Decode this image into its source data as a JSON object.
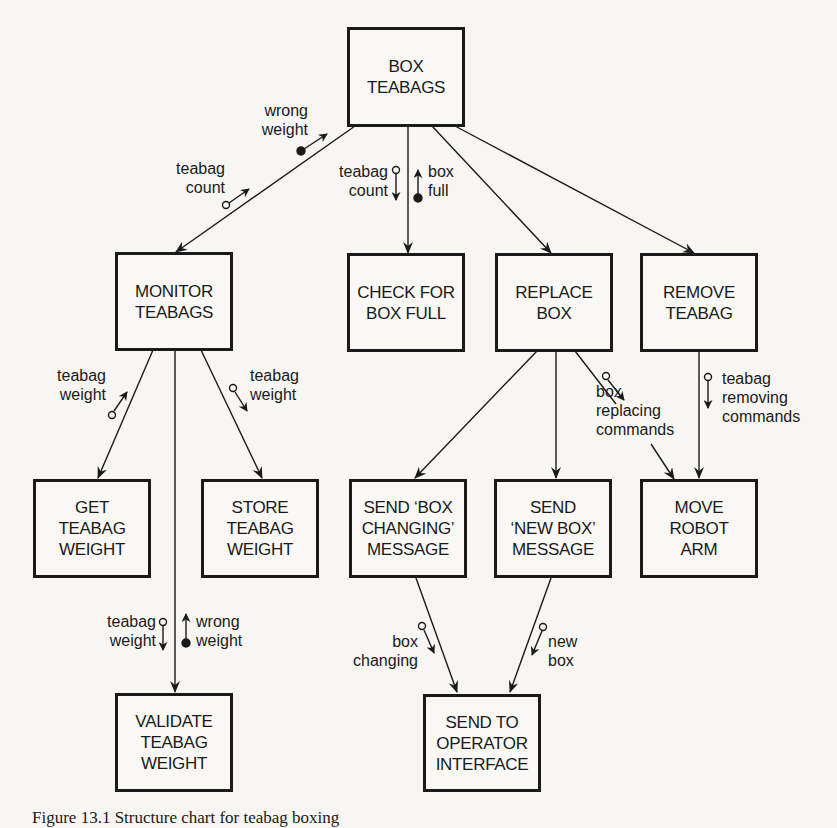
{
  "diagram": {
    "title": "Structure chart",
    "modules": {
      "box_teabags": "BOX\nTEABAGS",
      "monitor_teabags": "MONITOR\nTEABAGS",
      "check_for_box_full": "CHECK FOR\nBOX FULL",
      "replace_box": "REPLACE\nBOX",
      "remove_teabag": "REMOVE\nTEABAG",
      "get_teabag_weight": "GET\nTEABAG\nWEIGHT",
      "store_teabag_weight": "STORE\nTEABAG\nWEIGHT",
      "send_box_changing_message": "SEND ‘BOX\nCHANGING’\nMESSAGE",
      "send_new_box_message": "SEND\n‘NEW BOX’\nMESSAGE",
      "move_robot_arm": "MOVE\nROBOT\nARM",
      "validate_teabag_weight": "VALIDATE\nTEABAG\nWEIGHT",
      "send_to_operator_interface": "SEND TO\nOPERATOR\nINTERFACE"
    },
    "couples": {
      "wrong_weight_top": "wrong\nweight",
      "teabag_count_left": "teabag\ncount",
      "teabag_count_center": "teabag\ncount",
      "box_full": "box\nfull",
      "teabag_weight_get": "teabag\nweight",
      "teabag_weight_store": "teabag\nweight",
      "teabag_weight_validate": "teabag\nweight",
      "wrong_weight_validate": "wrong\nweight",
      "box_replacing_commands": "box\nreplacing\ncommands",
      "teabag_removing_commands": "teabag\nremoving\ncommands",
      "box_changing": "box\nchanging",
      "new_box": "new\nbox"
    },
    "connections": [
      {
        "from": "BOX TEABAGS",
        "to": "MONITOR TEABAGS"
      },
      {
        "from": "BOX TEABAGS",
        "to": "CHECK FOR BOX FULL"
      },
      {
        "from": "BOX TEABAGS",
        "to": "REPLACE BOX"
      },
      {
        "from": "BOX TEABAGS",
        "to": "REMOVE TEABAG"
      },
      {
        "from": "MONITOR TEABAGS",
        "to": "GET TEABAG WEIGHT"
      },
      {
        "from": "MONITOR TEABAGS",
        "to": "STORE TEABAG WEIGHT"
      },
      {
        "from": "MONITOR TEABAGS",
        "to": "VALIDATE TEABAG WEIGHT"
      },
      {
        "from": "REPLACE BOX",
        "to": "SEND 'BOX CHANGING' MESSAGE"
      },
      {
        "from": "REPLACE BOX",
        "to": "SEND 'NEW BOX' MESSAGE"
      },
      {
        "from": "REPLACE BOX",
        "to": "MOVE ROBOT ARM"
      },
      {
        "from": "REMOVE TEABAG",
        "to": "MOVE ROBOT ARM"
      },
      {
        "from": "SEND 'BOX CHANGING' MESSAGE",
        "to": "SEND TO OPERATOR INTERFACE"
      },
      {
        "from": "SEND 'NEW BOX' MESSAGE",
        "to": "SEND TO OPERATOR INTERFACE"
      }
    ],
    "legend": {
      "data_couple": "open circle",
      "control_flag": "filled circle"
    },
    "colors": {
      "ink": "#1a1a1a",
      "paper": "#f7f6f3"
    }
  },
  "caption": "Figure 13.1   Structure chart for teabag boxing"
}
